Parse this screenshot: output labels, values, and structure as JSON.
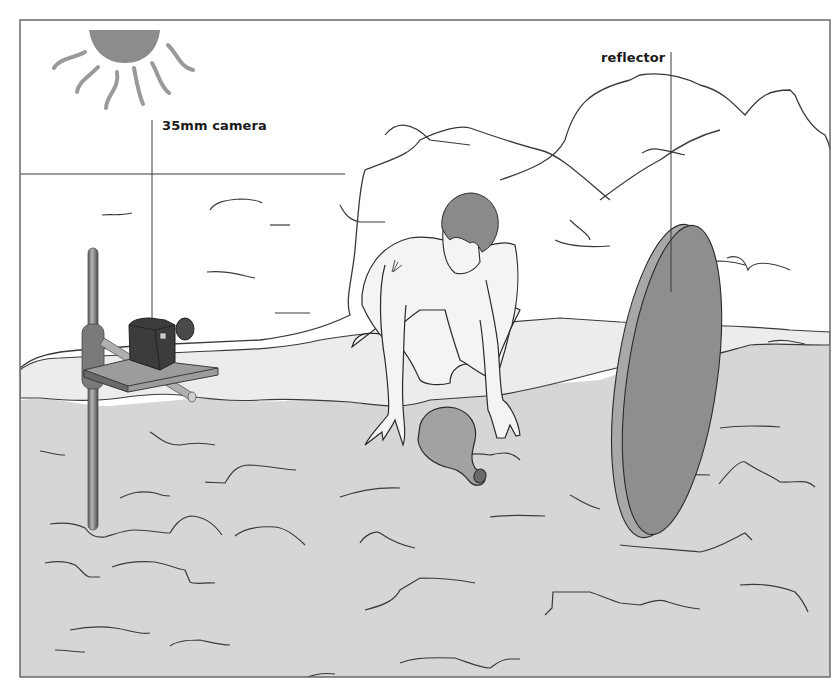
{
  "figure": {
    "labels": {
      "camera": "35mm camera",
      "reflector": "reflector"
    },
    "elements": [
      "sun",
      "horizon-line",
      "rock-mounds",
      "sand-ground",
      "camera-stand",
      "35mm-camera",
      "kneeling-person",
      "clay-pot",
      "reflector-disc"
    ]
  },
  "colors": {
    "background": "#ffffff",
    "frame": "#6a6a6a",
    "line": "#3a3a3a",
    "sun": "#8c8c8c",
    "sand": "#d6d6d6",
    "mounds_light": "#ececec",
    "reflector_face": "#8e8e8e",
    "reflector_edge": "#a8a8a8",
    "camera_body": "#3c3c3c",
    "stand": "#8a8a8a",
    "pot": "#a2a2a2",
    "hair": "#8a8a8a",
    "skin": "#f4f4f4"
  }
}
